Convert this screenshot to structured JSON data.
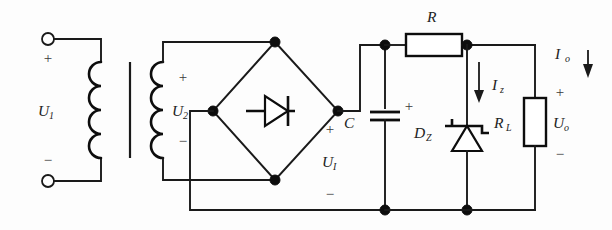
{
  "figure": {
    "name": "regulated-dc-power-supply-schematic",
    "type": "electronic-circuit-diagram"
  },
  "labels": {
    "u1_primary": "U",
    "u1_primary_sub": "1",
    "u2_secondary": "U",
    "u2_secondary_sub": "2",
    "ui_rectified": "U",
    "ui_rectified_sub": "I",
    "capacitor": "C",
    "resistor_series": "R",
    "zener": "D",
    "zener_sub": "Z",
    "load_resistor": "R",
    "load_resistor_sub": "L",
    "output_voltage": "U",
    "output_voltage_sub": "o",
    "zener_current": "I",
    "zener_current_sub": "z",
    "output_current": "I",
    "output_current_sub": "o"
  },
  "polarity": {
    "primary_plus": "+",
    "primary_minus": "−",
    "secondary_plus": "+",
    "secondary_minus": "−",
    "rectified_plus": "+",
    "rectified_minus": "−",
    "capacitor_plus": "+",
    "output_plus": "+",
    "output_minus": "−"
  },
  "components": [
    {
      "id": "transformer",
      "name": "transformer",
      "kind": "iron-core-transformer"
    },
    {
      "id": "bridge",
      "name": "bridge-rectifier",
      "kind": "full-wave-bridge"
    },
    {
      "id": "capacitor-c",
      "name": "filter-capacitor",
      "kind": "polarized-capacitor"
    },
    {
      "id": "resistor-r",
      "name": "series-resistor",
      "kind": "resistor"
    },
    {
      "id": "zener-dz",
      "name": "zener-diode",
      "kind": "zener-diode"
    },
    {
      "id": "resistor-rl",
      "name": "load-resistor",
      "kind": "resistor"
    }
  ],
  "colors": {
    "ink": "#1a1a1a",
    "background": "#fdfdfd",
    "label": "#232323"
  }
}
